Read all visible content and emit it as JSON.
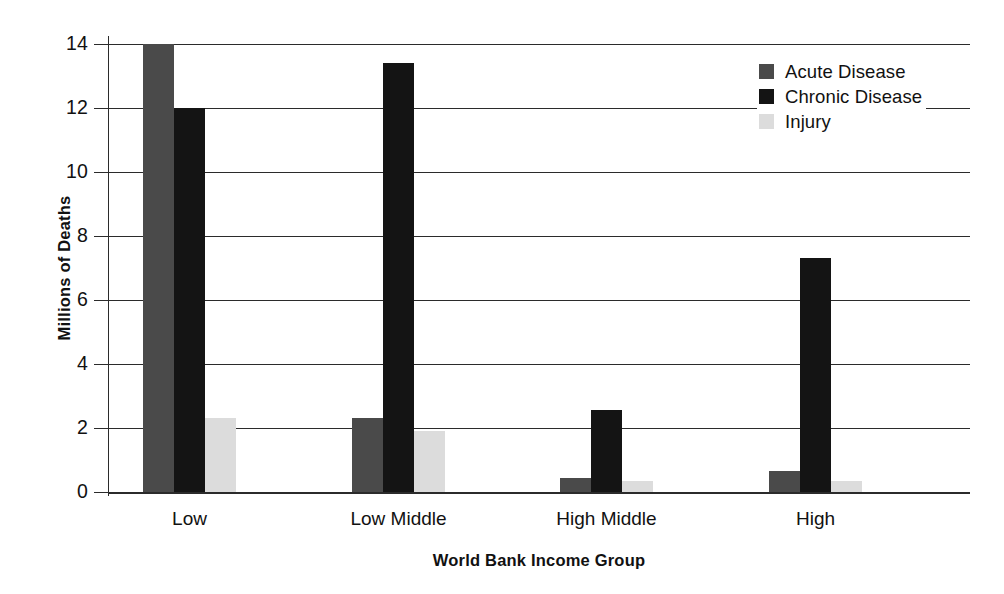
{
  "chart_data": {
    "type": "bar",
    "title": "",
    "xlabel": "World Bank Income Group",
    "ylabel": "Millions of Deaths",
    "categories": [
      "Low",
      "Low Middle",
      "High Middle",
      "High"
    ],
    "series": [
      {
        "name": "Acute Disease",
        "color": "#4a4a4a",
        "values": [
          14.0,
          2.3,
          0.45,
          0.65
        ]
      },
      {
        "name": "Chronic Disease",
        "color": "#141414",
        "values": [
          12.0,
          13.4,
          2.55,
          7.3
        ]
      },
      {
        "name": "Injury",
        "color": "#dcdcdc",
        "values": [
          2.3,
          1.9,
          0.35,
          0.35
        ]
      }
    ],
    "ylim": [
      0,
      14
    ],
    "yticks": [
      0,
      2,
      4,
      6,
      8,
      10,
      12,
      14
    ],
    "ytick_labels": [
      "0",
      "2",
      "4",
      "6",
      "8",
      "10",
      "12",
      "14"
    ],
    "grid": true,
    "grid_axis": "y",
    "legend_position": "top-right",
    "legend_entries": [
      "Acute Disease",
      "Chronic Disease",
      "Injury"
    ]
  },
  "axes": {
    "y_title": "Millions of Deaths",
    "x_title": "World Bank Income Group"
  },
  "legend": {
    "items": [
      {
        "label": "Acute Disease",
        "swatch": "acute-swatch"
      },
      {
        "label": "Chronic Disease",
        "swatch": "chronic-swatch"
      },
      {
        "label": "Injury",
        "swatch": "injury-swatch"
      }
    ]
  }
}
